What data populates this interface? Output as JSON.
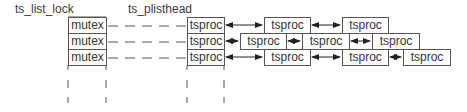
{
  "labels": {
    "list_lock": "ts_list_lock",
    "plisthead": "ts_plisthead"
  },
  "mutex_column": [
    "mutex",
    "mutex",
    "mutex"
  ],
  "head_column": [
    "tsproc",
    "tsproc",
    "tsproc"
  ],
  "rows": [
    {
      "nodes": [
        "tsproc",
        "tsproc"
      ]
    },
    {
      "nodes": [
        "tsproc",
        "tsproc",
        "tsproc"
      ]
    },
    {
      "nodes": [
        "tsproc",
        "tsproc",
        "tsproc"
      ]
    }
  ],
  "colors": {
    "line": "#555555",
    "text": "#333333",
    "background": "#ffffff"
  }
}
